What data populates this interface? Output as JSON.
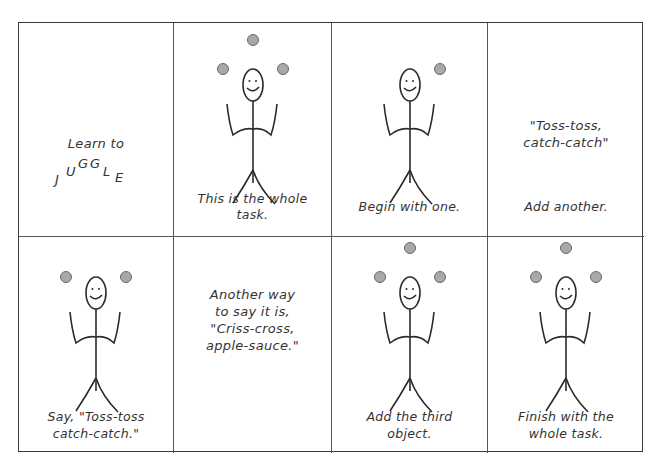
{
  "panels": [
    {
      "id": 1,
      "type": "title",
      "line1": "Learn to",
      "juggle_letters": [
        "J",
        "U",
        "G",
        "G",
        "L",
        "E"
      ]
    },
    {
      "id": 2,
      "type": "figure",
      "balls": 3,
      "caption_line1": "This is the whole",
      "caption_line2": "task."
    },
    {
      "id": 3,
      "type": "figure",
      "balls": 1,
      "caption_line1": "Begin with one.",
      "caption_line2": ""
    },
    {
      "id": 4,
      "type": "text",
      "quote_line1": "\"Toss-toss,",
      "quote_line2": "catch-catch\"",
      "caption_line1": "Add another."
    },
    {
      "id": 5,
      "type": "figure",
      "balls": 2,
      "caption_line1": "Say, \"Toss-toss",
      "caption_line2": "catch-catch.\""
    },
    {
      "id": 6,
      "type": "text",
      "lines": [
        "Another way",
        "to say it is,",
        "\"Criss-cross,",
        "apple-sauce.\""
      ]
    },
    {
      "id": 7,
      "type": "figure",
      "balls": 3,
      "caption_line1": "Add the third",
      "caption_line2": "object."
    },
    {
      "id": 8,
      "type": "figure",
      "balls": 3,
      "caption_line1": "Finish with the",
      "caption_line2": "whole task."
    }
  ],
  "colors": {
    "ball_fill": "#a8a8a8",
    "ball_stroke": "#6a6a6a",
    "line": "#2a2a2a",
    "border": "#3a3a3a"
  }
}
